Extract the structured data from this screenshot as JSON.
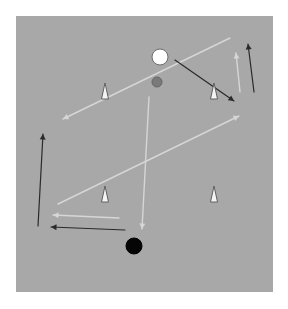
{
  "diagram": {
    "type": "drill-diagram",
    "field": {
      "x": 16,
      "y": 16,
      "width": 257,
      "height": 276,
      "color": "#a8a8a8"
    },
    "colors": {
      "light_line": "#d6d6d6",
      "dark_line": "#2a2a2a",
      "cone_fill": "#f4f4f4",
      "cone_stroke": "#555555"
    },
    "balls": [
      {
        "id": "white-ball",
        "x": 160,
        "y": 57,
        "r": 8,
        "fill": "#ffffff",
        "stroke": "#6a6a6a"
      },
      {
        "id": "gray-ball",
        "x": 157,
        "y": 82,
        "r": 5,
        "fill": "#7a7a7a",
        "stroke": "#666666"
      },
      {
        "id": "black-ball",
        "x": 134,
        "y": 246,
        "r": 8,
        "fill": "#050505",
        "stroke": "#000000"
      }
    ],
    "cones": [
      {
        "id": "cone-top-left",
        "x": 105,
        "y": 95
      },
      {
        "id": "cone-top-right",
        "x": 214,
        "y": 95
      },
      {
        "id": "cone-bottom-left",
        "x": 105,
        "y": 198
      },
      {
        "id": "cone-bottom-right",
        "x": 214,
        "y": 198
      }
    ],
    "paths": [
      {
        "id": "pass-top-diagonal",
        "style": "light",
        "x1": 230,
        "y1": 38,
        "x2": 63,
        "y2": 119
      },
      {
        "id": "run-ball-to-corner",
        "style": "dark",
        "x1": 175,
        "y1": 60,
        "x2": 234,
        "y2": 101
      },
      {
        "id": "pass-right-up",
        "style": "light",
        "x1": 240,
        "y1": 92,
        "x2": 236,
        "y2": 53
      },
      {
        "id": "run-right-up",
        "style": "dark",
        "x1": 254,
        "y1": 92,
        "x2": 248,
        "y2": 44
      },
      {
        "id": "pass-long-diagonal",
        "style": "light",
        "x1": 58,
        "y1": 204,
        "x2": 239,
        "y2": 116
      },
      {
        "id": "pass-center-down",
        "style": "light",
        "x1": 149,
        "y1": 97,
        "x2": 142,
        "y2": 229
      },
      {
        "id": "run-left-up",
        "style": "dark",
        "x1": 38,
        "y1": 226,
        "x2": 43,
        "y2": 134
      },
      {
        "id": "pass-bottom-left",
        "style": "light",
        "x1": 119,
        "y1": 218,
        "x2": 53,
        "y2": 215
      },
      {
        "id": "run-bottom-left",
        "style": "dark",
        "x1": 125,
        "y1": 230,
        "x2": 51,
        "y2": 227
      }
    ]
  }
}
